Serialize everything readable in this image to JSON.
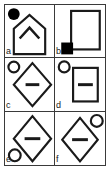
{
  "plate": {
    "type": "figure-plate",
    "rows": 3,
    "columns": 2,
    "border_color": "#3a3a3a",
    "background": "#ffffff",
    "stroke_color": "#1a1a1a",
    "fill_color": "#000000"
  },
  "panels": [
    {
      "label": "a",
      "label_position": "bottom-left",
      "main_shape": "pentagon-house",
      "inner_shape": "chevron-up",
      "marker": "filled-circle",
      "marker_position": "top-left"
    },
    {
      "label": "b",
      "label_position": "bottom-left",
      "main_shape": "rectangle",
      "inner_shape": "none",
      "marker": "filled-square",
      "marker_position": "bottom-left"
    },
    {
      "label": "c",
      "label_position": "bottom-left",
      "main_shape": "diamond",
      "inner_shape": "horizontal-bar",
      "marker": "open-circle",
      "marker_position": "top-left"
    },
    {
      "label": "d",
      "label_position": "bottom-left",
      "main_shape": "rectangle",
      "inner_shape": "horizontal-bar",
      "marker": "open-circle",
      "marker_position": "top-left"
    },
    {
      "label": "e",
      "label_position": "bottom-left",
      "main_shape": "diamond",
      "inner_shape": "horizontal-bar",
      "marker": "open-circle",
      "marker_position": "bottom-left"
    },
    {
      "label": "f",
      "label_position": "bottom-left",
      "main_shape": "diamond",
      "inner_shape": "horizontal-bar",
      "marker": "open-circle",
      "marker_position": "top-right"
    }
  ]
}
